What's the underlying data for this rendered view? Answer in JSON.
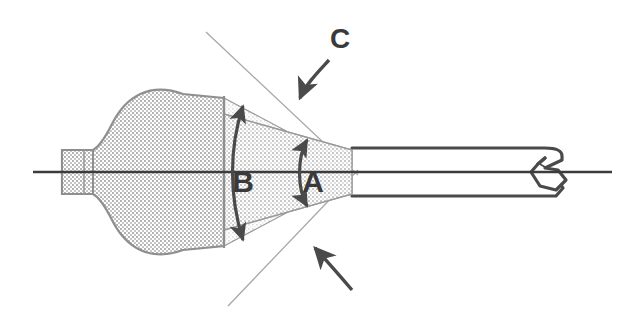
{
  "figure": {
    "background_color": "#ffffff",
    "outline_color": "#4a4a4a",
    "centerline_color": "#3c3c3c",
    "construction_line_color": "#a8a8a8",
    "label_color": "#3a3a3a",
    "bulb_fill_color": "#cfcfcf",
    "cone_fill_color": "#d8d8d8",
    "wedge_fill_color": "#eaeaea"
  },
  "labels": [
    {
      "id": "label-b",
      "text": "B",
      "x": 243,
      "y": 192,
      "font_size": 30,
      "meaning": "outer-cone-included-angle"
    },
    {
      "id": "label-a",
      "text": "A",
      "x": 313,
      "y": 192,
      "font_size": 30,
      "meaning": "inner-cone-included-angle"
    },
    {
      "id": "label-c",
      "text": "C",
      "x": 340,
      "y": 48,
      "font_size": 28,
      "meaning": "construction-line-angle"
    }
  ],
  "dimension_arcs": [
    {
      "id": "arc-b",
      "label": "B",
      "double_headed": true,
      "description": "double-headed arc spanning the full outer cone flare"
    },
    {
      "id": "arc-a",
      "label": "A",
      "double_headed": true,
      "description": "double-headed arc spanning the inner cone angle"
    }
  ],
  "leader_arrows": [
    {
      "id": "leader-c-upper",
      "from_label": "C",
      "points_to": "upper-construction-line",
      "direction": "down-left"
    },
    {
      "id": "leader-c-lower",
      "from_label": "C",
      "points_to": "lower-construction-line",
      "direction": "up-left"
    }
  ],
  "parts": [
    {
      "id": "left-stub",
      "name": "left-stub",
      "description": "small rectangular stub at far left with vertical divider"
    },
    {
      "id": "bulb",
      "name": "bulb-body",
      "description": "rounded teardrop reservoir with stippled fill"
    },
    {
      "id": "cone",
      "name": "tapered-cone",
      "description": "cone narrowing to the right toward the tube"
    },
    {
      "id": "wedge-upper",
      "name": "upper-flare-wedge",
      "description": "light wedge above the cone"
    },
    {
      "id": "wedge-lower",
      "name": "lower-flare-wedge",
      "description": "light wedge below the cone"
    },
    {
      "id": "tube",
      "name": "outlet-tube",
      "description": "straight parallel-sided tube extending right"
    },
    {
      "id": "tube-tip",
      "name": "tube-tip-hook",
      "description": "hooked bulbous tip at the right end of the tube"
    },
    {
      "id": "centerline",
      "name": "axis-centerline",
      "description": "horizontal axis line running the full width"
    },
    {
      "id": "construction-upper",
      "name": "upper-construction-line",
      "description": "thin line through the apex going up-left"
    },
    {
      "id": "construction-lower",
      "name": "lower-construction-line",
      "description": "thin line through the apex going down-left"
    }
  ],
  "geometry": {
    "apex_x": 355,
    "apex_y": 172,
    "axis_y": 172,
    "tube_right_x": 565,
    "centerline_x1": 33,
    "centerline_x2": 612
  }
}
